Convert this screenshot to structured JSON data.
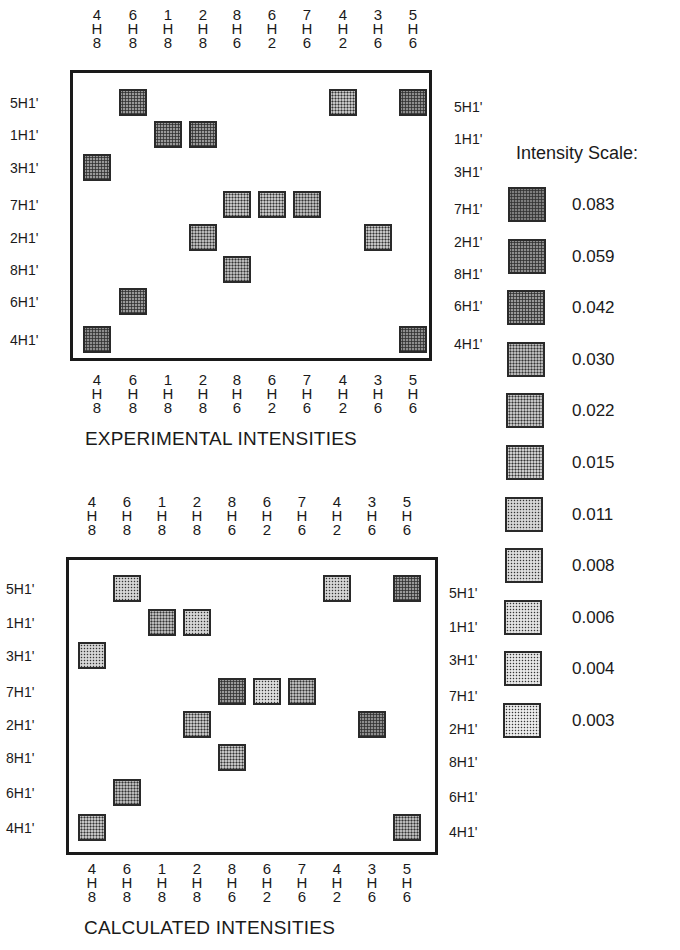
{
  "chart_data": {
    "type": "heatmap",
    "columns": [
      "4H8",
      "6H8",
      "1H8",
      "2H8",
      "8H6",
      "6H2",
      "7H6",
      "4H2",
      "3H6",
      "5H6"
    ],
    "column_labels_stacked": [
      [
        "4",
        "H",
        "8"
      ],
      [
        "6",
        "H",
        "8"
      ],
      [
        "1",
        "H",
        "8"
      ],
      [
        "2",
        "H",
        "8"
      ],
      [
        "8",
        "H",
        "6"
      ],
      [
        "6",
        "H",
        "2"
      ],
      [
        "7",
        "H",
        "6"
      ],
      [
        "4",
        "H",
        "2"
      ],
      [
        "3",
        "H",
        "6"
      ],
      [
        "5",
        "H",
        "6"
      ]
    ],
    "rows": [
      "5H1'",
      "1H1'",
      "3H1'",
      "7H1'",
      "2H1'",
      "8H1'",
      "6H1'",
      "4H1'"
    ],
    "legend": {
      "title": "Intensity Scale:",
      "levels": [
        0.083,
        0.059,
        0.042,
        0.03,
        0.022,
        0.015,
        0.011,
        0.008,
        0.006,
        0.004,
        0.003
      ]
    },
    "panels": [
      {
        "name": "EXPERIMENTAL INTENSITIES",
        "cells": [
          {
            "row": "5H1'",
            "col": "6H8",
            "value": 0.042
          },
          {
            "row": "5H1'",
            "col": "4H2",
            "value": 0.022
          },
          {
            "row": "5H1'",
            "col": "5H6",
            "value": 0.059
          },
          {
            "row": "1H1'",
            "col": "1H8",
            "value": 0.042
          },
          {
            "row": "1H1'",
            "col": "2H8",
            "value": 0.042
          },
          {
            "row": "3H1'",
            "col": "4H8",
            "value": 0.042
          },
          {
            "row": "7H1'",
            "col": "8H6",
            "value": 0.022
          },
          {
            "row": "7H1'",
            "col": "6H2",
            "value": 0.022
          },
          {
            "row": "7H1'",
            "col": "7H6",
            "value": 0.03
          },
          {
            "row": "2H1'",
            "col": "2H8",
            "value": 0.03
          },
          {
            "row": "2H1'",
            "col": "3H6",
            "value": 0.022
          },
          {
            "row": "8H1'",
            "col": "8H6",
            "value": 0.03
          },
          {
            "row": "6H1'",
            "col": "6H8",
            "value": 0.042
          },
          {
            "row": "4H1'",
            "col": "4H8",
            "value": 0.059
          },
          {
            "row": "4H1'",
            "col": "5H6",
            "value": 0.059
          }
        ]
      },
      {
        "name": "CALCULATED INTENSITIES",
        "cells": [
          {
            "row": "5H1'",
            "col": "6H8",
            "value": 0.011
          },
          {
            "row": "5H1'",
            "col": "4H2",
            "value": 0.011
          },
          {
            "row": "5H1'",
            "col": "5H6",
            "value": 0.042
          },
          {
            "row": "1H1'",
            "col": "1H8",
            "value": 0.03
          },
          {
            "row": "1H1'",
            "col": "2H8",
            "value": 0.011
          },
          {
            "row": "3H1'",
            "col": "4H8",
            "value": 0.011
          },
          {
            "row": "7H1'",
            "col": "8H6",
            "value": 0.042
          },
          {
            "row": "7H1'",
            "col": "6H2",
            "value": 0.008
          },
          {
            "row": "7H1'",
            "col": "7H6",
            "value": 0.03
          },
          {
            "row": "2H1'",
            "col": "2H8",
            "value": 0.022
          },
          {
            "row": "2H1'",
            "col": "3H6",
            "value": 0.059
          },
          {
            "row": "8H1'",
            "col": "8H6",
            "value": 0.022
          },
          {
            "row": "6H1'",
            "col": "6H8",
            "value": 0.03
          },
          {
            "row": "4H1'",
            "col": "4H8",
            "value": 0.022
          },
          {
            "row": "4H1'",
            "col": "5H6",
            "value": 0.03
          }
        ]
      }
    ],
    "xlabel": "",
    "ylabel": "",
    "grid": false,
    "legend_position": "right"
  },
  "panels": {
    "experimental": {
      "title": "EXPERIMENTAL INTENSITIES"
    },
    "calculated": {
      "title": "CALCULATED INTENSITIES"
    }
  },
  "legend_title": "Intensity Scale:",
  "legend_values": [
    "0.083",
    "0.059",
    "0.042",
    "0.030",
    "0.022",
    "0.015",
    "0.011",
    "0.008",
    "0.006",
    "0.004",
    "0.003"
  ],
  "shade_colors": {
    "0.083": "#8a8a8a",
    "0.059": "#9c9c9c",
    "0.042": "#aaaaaa",
    "0.030": "#b8b8b8",
    "0.022": "#c3c3c3",
    "0.015": "#cdcdcd",
    "0.011": "#d6d6d6",
    "0.008": "#dedede",
    "0.006": "#e3e3e3",
    "0.004": "#e8e8e8",
    "0.003": "#ececec"
  }
}
